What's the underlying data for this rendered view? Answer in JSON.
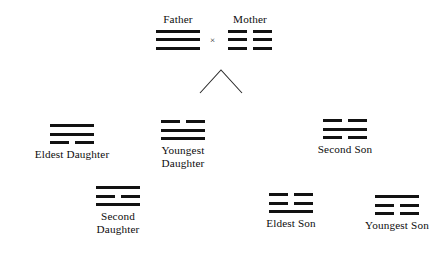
{
  "diagram": {
    "relation_symbol": "×",
    "branch_symbol": "chevron",
    "ink_color": "#121212",
    "background_color": "#ffffff"
  },
  "parents": [
    {
      "label": "Father",
      "trigram_name": "Qian",
      "unicode": "☰",
      "lines": [
        "solid",
        "solid",
        "solid"
      ]
    },
    {
      "label": "Mother",
      "trigram_name": "Kun",
      "unicode": "☷",
      "lines": [
        "broken",
        "broken",
        "broken"
      ]
    }
  ],
  "children": [
    {
      "label": "Eldest Daughter",
      "trigram_name": "Xun",
      "unicode": "☴",
      "lines": [
        "solid",
        "solid",
        "broken"
      ]
    },
    {
      "label": "Youngest\nDaughter",
      "trigram_name": "Dui",
      "unicode": "☱",
      "lines": [
        "broken",
        "solid",
        "solid"
      ]
    },
    {
      "label": "Second Son",
      "trigram_name": "Kan",
      "unicode": "☵",
      "lines": [
        "broken",
        "solid",
        "broken"
      ]
    },
    {
      "label": "Second\nDaughter",
      "trigram_name": "Li",
      "unicode": "☲",
      "lines": [
        "solid",
        "broken",
        "solid"
      ]
    },
    {
      "label": "Eldest Son",
      "trigram_name": "Zhen",
      "unicode": "☳",
      "lines": [
        "broken",
        "broken",
        "solid"
      ]
    },
    {
      "label": "Youngest Son",
      "trigram_name": "Gen",
      "unicode": "☶",
      "lines": [
        "solid",
        "broken",
        "broken"
      ]
    }
  ]
}
